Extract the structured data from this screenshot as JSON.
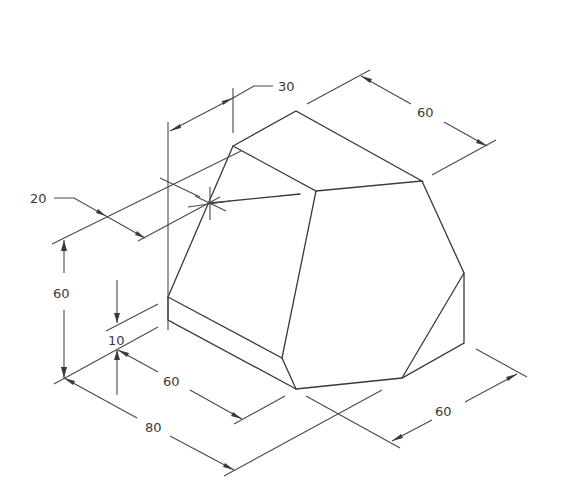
{
  "drawing": {
    "type": "isometric-technical-drawing",
    "line_color": "#3a3a3a",
    "background": "#ffffff"
  },
  "dimensions": {
    "top_offset": "30",
    "top_depth": "60",
    "left_offset": "20",
    "height": "60",
    "base_height": "10",
    "front_width": "60",
    "total_length": "80",
    "right_depth": "60"
  }
}
